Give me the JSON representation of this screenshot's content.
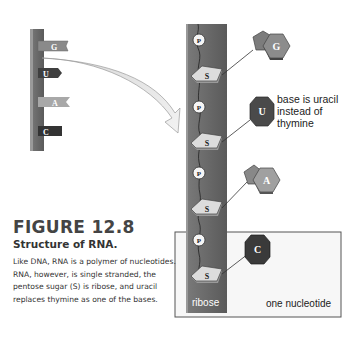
{
  "figure": {
    "number": "FIGURE 12.8",
    "title": "Structure of RNA.",
    "caption": "Like DNA, RNA is a polymer of nucleotides. RNA, however, is single stranded, the pentose sugar (S) is ribose, and uracil replaces thymine as one of the bases."
  },
  "small_strand": {
    "bases": [
      "G",
      "U",
      "A",
      "C"
    ]
  },
  "strand": {
    "phosphate_label": "P",
    "sugar_label": "S",
    "bases": [
      "G",
      "U",
      "A",
      "C"
    ],
    "sugar_name": "ribose"
  },
  "annotations": {
    "base_note": "base is uracil instead of thymine",
    "nucleotide_label": "one nucleotide"
  },
  "colors": {
    "backbone": "#6d6d6d",
    "sugar_fill": "#d9d9d9",
    "G": "#8a8a8a",
    "U": "#4a4a4a",
    "A": "#9a9a9a",
    "C": "#3a3a3a"
  }
}
